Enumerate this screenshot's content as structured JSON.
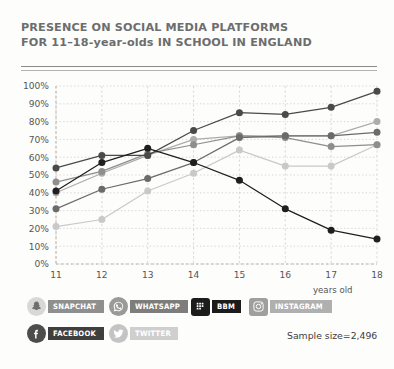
{
  "title": {
    "line1": "PRESENCE ON SOCIAL MEDIA PLATFORMS",
    "line2": "FOR 11–18-year-olds IN SCHOOL IN ENGLAND"
  },
  "axis_caption": "years old",
  "sample_size": "Sample size=2,496",
  "colors": {
    "snapchat": "#6b6b6b",
    "whatsapp": "#8e8e8e",
    "bbm": "#1f1f1f",
    "instagram": "#adadad",
    "facebook": "#4a4a4a",
    "twitter": "#c9c9c9",
    "grid": "#d9d2d2",
    "axis": "#b9b2b2",
    "text": "#555555"
  },
  "legend": {
    "rows": [
      [
        {
          "name": "snapchat",
          "label": "SNAPCHAT",
          "icon": "snapchat-ghost-icon",
          "badge_color": "#d8d8d8",
          "pill_color": "#8f8f8f",
          "badge_shape": "circle"
        },
        {
          "name": "whatsapp",
          "label": "WHATSAPP",
          "icon": "whatsapp-phone-icon",
          "badge_color": "#9a9a9a",
          "pill_color": "#7d7d7d",
          "badge_shape": "circle"
        },
        {
          "name": "bbm",
          "label": "BBM",
          "icon": "bbm-chat-icon",
          "badge_color": "#1c1c1c",
          "pill_color": "#1c1c1c",
          "badge_shape": "square"
        },
        {
          "name": "instagram",
          "label": "INSTAGRAM",
          "icon": "instagram-camera-icon",
          "badge_color": "#9f9f9f",
          "pill_color": "#b0b0b0",
          "badge_shape": "square"
        }
      ],
      [
        {
          "name": "facebook",
          "label": "FACEBOOK",
          "icon": "facebook-f-icon",
          "badge_color": "#4d4d4d",
          "pill_color": "#3f3f3f",
          "badge_shape": "circle"
        },
        {
          "name": "twitter",
          "label": "TWITTER",
          "icon": "twitter-bird-icon",
          "badge_color": "#c4c4c4",
          "pill_color": "#cfcfcf",
          "badge_shape": "circle"
        }
      ]
    ]
  },
  "chart_data": {
    "type": "line",
    "title": "PRESENCE ON SOCIAL MEDIA PLATFORMS FOR 11–18-year-olds IN SCHOOL IN ENGLAND",
    "xlabel": "years old",
    "ylabel": "",
    "x": [
      11,
      12,
      13,
      14,
      15,
      16,
      17,
      18
    ],
    "categories": [
      "11",
      "12",
      "13",
      "14",
      "15",
      "16",
      "17",
      "18"
    ],
    "ylim": [
      0,
      100
    ],
    "yticks": [
      0,
      10,
      20,
      30,
      40,
      50,
      60,
      70,
      80,
      90,
      100
    ],
    "ytick_labels": [
      "0%",
      "10%",
      "20%",
      "30%",
      "40%",
      "50%",
      "60%",
      "70%",
      "80%",
      "90%",
      "100%"
    ],
    "grid": true,
    "legend_position": "below",
    "units": "percent",
    "sample_size": 2496,
    "series": [
      {
        "name": "Snapchat",
        "color": "#6b6b6b",
        "values": [
          31,
          42,
          48,
          57,
          71,
          72,
          72,
          74
        ]
      },
      {
        "name": "WhatsApp",
        "color": "#8e8e8e",
        "values": [
          46,
          52,
          62,
          67,
          72,
          71,
          66,
          67
        ]
      },
      {
        "name": "BBM",
        "color": "#1f1f1f",
        "values": [
          41,
          57,
          65,
          57,
          47,
          31,
          19,
          14
        ]
      },
      {
        "name": "Instagram",
        "color": "#adadad",
        "values": [
          40,
          51,
          61,
          70,
          72,
          72,
          72,
          80
        ]
      },
      {
        "name": "Facebook",
        "color": "#4a4a4a",
        "values": [
          54,
          61,
          61,
          75,
          85,
          84,
          88,
          97
        ]
      },
      {
        "name": "Twitter",
        "color": "#c9c9c9",
        "values": [
          21,
          25,
          41,
          51,
          64,
          55,
          55,
          67
        ]
      }
    ]
  }
}
